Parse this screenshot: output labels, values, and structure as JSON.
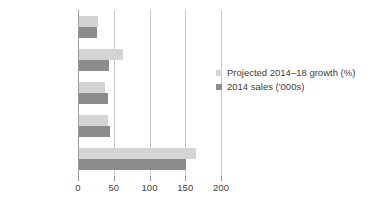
{
  "chart_data": {
    "type": "bar",
    "orientation": "horizontal",
    "title": "",
    "xlabel": "",
    "ylabel": "",
    "xlim": [
      0,
      200
    ],
    "xticks": [
      0,
      50,
      100,
      150,
      200
    ],
    "xtick_labels": [
      "0",
      "50",
      "100",
      "150",
      "200"
    ],
    "grid": true,
    "grid_axis": "x",
    "legend_position": "right",
    "categories": [
      "Germany",
      "South Korea",
      "Japan",
      "North America",
      "China"
    ],
    "series": [
      {
        "name": "Projected 2014–18 growth (%)",
        "color": "#d4d4d4",
        "values": [
          27,
          62,
          36,
          41,
          163
        ]
      },
      {
        "name": "2014 sales ('000s)",
        "color": "#8c8c8c",
        "values": [
          25,
          42,
          41,
          44,
          150
        ]
      }
    ]
  }
}
